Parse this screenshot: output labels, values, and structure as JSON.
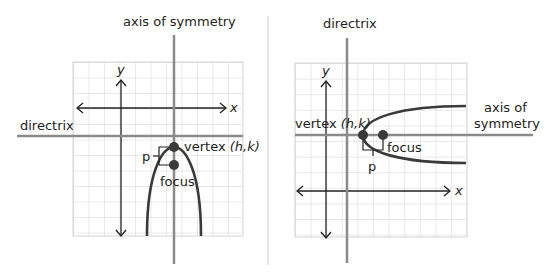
{
  "left_diagram": {
    "title": "axis of symmetry",
    "directrix_label": "directrix",
    "y_axis_label": "y",
    "x_axis_label": "x",
    "vertex_label_prefix": "vertex ",
    "vertex_label_coords": "(h,k)",
    "focus_label": "focus",
    "p_label": "p",
    "orientation": "opens down"
  },
  "right_diagram": {
    "title": "directrix",
    "axis_label_line1": "axis of",
    "axis_label_line2": "symmetry",
    "y_axis_label": "y",
    "x_axis_label": "x",
    "vertex_label_prefix": "vertex ",
    "vertex_label_coords": "(h,k)",
    "focus_label": "focus",
    "p_label": "p",
    "orientation": "opens right"
  },
  "colors": {
    "grid": "#d4d4d4",
    "heavy_line": "#8a8a8a",
    "curve": "#3a3a3a",
    "axis": "#231f20",
    "divider": "#cccccc",
    "text": "#231f20"
  }
}
